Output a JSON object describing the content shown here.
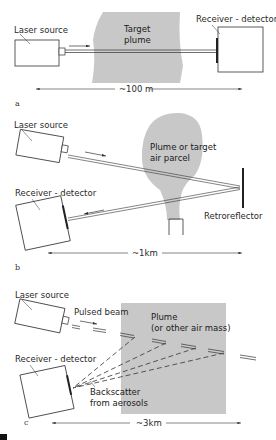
{
  "panels": [
    {
      "id": "a",
      "panel_label": "a",
      "laser_label": "Laser source",
      "receiver_label": "Receiver - detector",
      "plume_label_line1": "Target",
      "plume_label_line2": "plume",
      "distance_label": "~100 m"
    },
    {
      "id": "b",
      "panel_label": "b",
      "laser_label": "Laser source",
      "receiver_label": "Receiver - detector",
      "plume_label_line1": "Plume or target",
      "plume_label_line2": "air parcel",
      "retroreflector_label": "Retroreflector",
      "distance_label": "~1km"
    },
    {
      "id": "c",
      "panel_label": "c",
      "laser_label": "Laser source",
      "receiver_label": "Receiver - detector",
      "beam_label": "Pulsed beam",
      "plume_label_line1": "Plume",
      "plume_label_line2": "(or other air mass)",
      "backscatter_label_line1": "Backscatter",
      "backscatter_label_line2": "from aerosols",
      "distance_label": "~3km"
    }
  ],
  "colors": {
    "plume": "#c8c8c8",
    "line": "#333333",
    "background": "#ffffff"
  }
}
